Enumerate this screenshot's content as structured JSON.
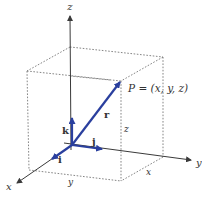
{
  "diagram": {
    "colors": {
      "axis": "#3a3a3a",
      "box": "#777777",
      "vector": "#2a3f9e",
      "text": "#333333"
    },
    "axes": {
      "x_label": "x",
      "y_label": "y",
      "z_label": "z"
    },
    "point_label": "P = (x, y, z)",
    "vectors": {
      "position": "r",
      "unit_i": "i",
      "unit_j": "j",
      "unit_k": "k"
    },
    "dimension_labels": {
      "x_along_bottom": "x",
      "y_along_bottom": "y",
      "z_height": "z"
    }
  }
}
